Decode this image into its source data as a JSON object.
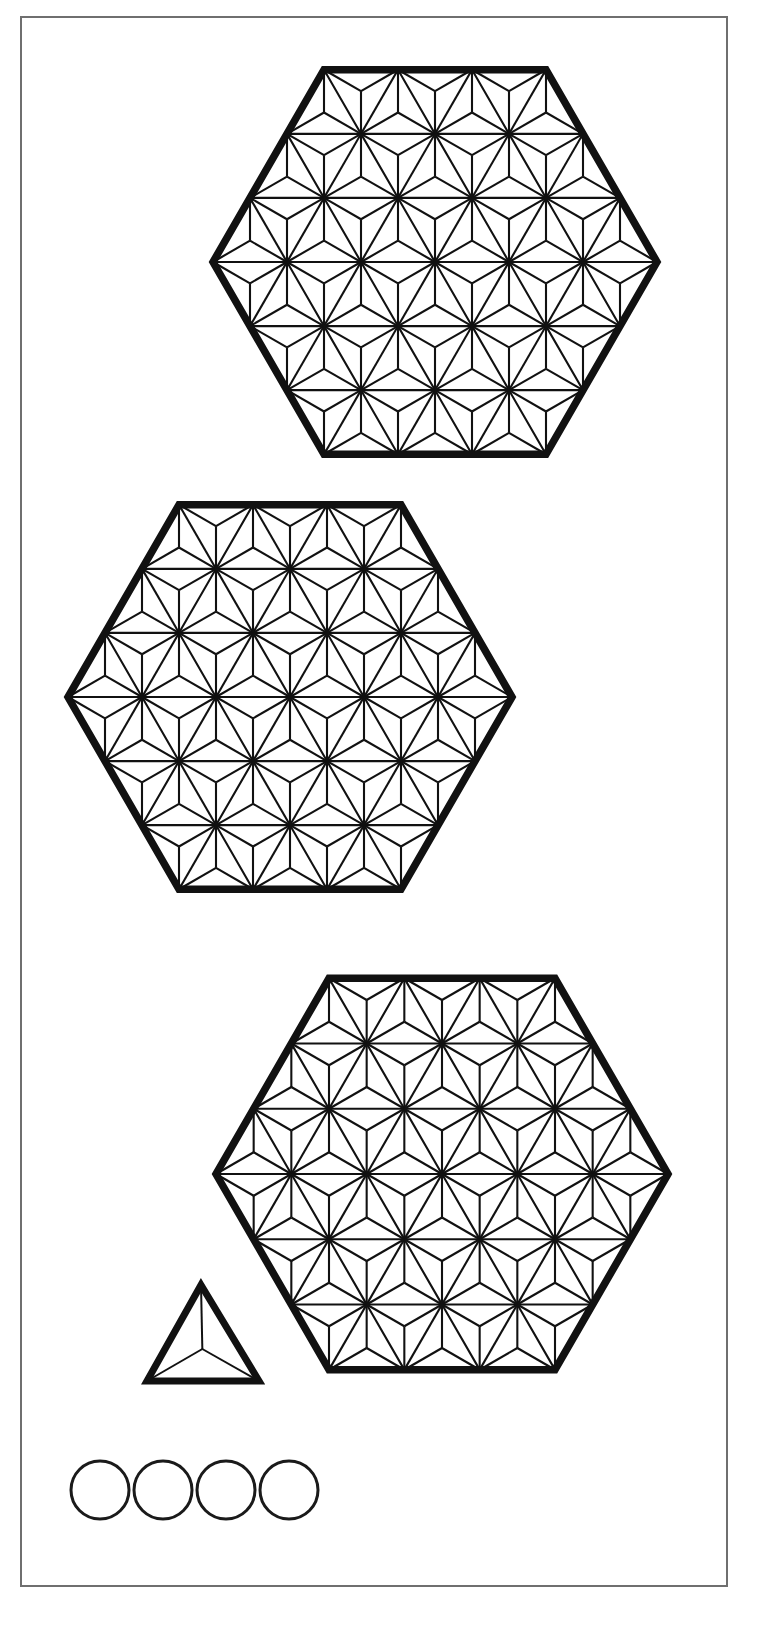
{
  "sheet": {
    "title": "Asanoha Hexagon Template Sheet",
    "width": 757,
    "height": 1626,
    "background_color": "#ffffff",
    "ink_color": "#111111",
    "frame_color": "#6f6f6f"
  },
  "page_frame": {
    "name": "page-border",
    "x": 21,
    "y": 17,
    "width": 706,
    "height": 1569,
    "stroke_width": 2,
    "color": "#6f6f6f"
  },
  "pattern": {
    "name": "asanoha-hemp-leaf",
    "description": "Triangular lattice with a three-armed Y star inside every lattice hexagon",
    "cells_across": 3,
    "lattice_stroke_width": 2.1,
    "outline_stroke_width": 7.5,
    "star_arms": 3
  },
  "shapes": {
    "hexagons": [
      {
        "label": "hexagon-top",
        "orientation": "flat-top",
        "center_x": 435,
        "center_y": 262,
        "radius": 222,
        "rings": 3,
        "left_vertex_x": 213,
        "right_vertex_x": 657,
        "top_edge_y": 63,
        "bottom_edge_y": 462
      },
      {
        "label": "hexagon-middle",
        "orientation": "flat-top",
        "center_x": 290,
        "center_y": 697,
        "radius": 222,
        "rings": 3,
        "left_vertex_x": 68,
        "right_vertex_x": 512,
        "top_edge_y": 498,
        "bottom_edge_y": 896
      },
      {
        "label": "hexagon-bottom",
        "orientation": "flat-top",
        "center_x": 442,
        "center_y": 1174,
        "radius": 226,
        "rings": 3,
        "left_vertex_x": 216,
        "right_vertex_x": 668,
        "top_edge_y": 971,
        "bottom_edge_y": 1377
      }
    ],
    "triangle": {
      "label": "triangle-with-star",
      "apex_x": 201,
      "apex_y": 1285,
      "base_left_x": 147,
      "base_right_x": 259,
      "base_y": 1381,
      "star_arms": 3,
      "stroke_width": 7
    },
    "circles": [
      {
        "label": "circle-1",
        "cx": 100,
        "cy": 1490,
        "r": 29
      },
      {
        "label": "circle-2",
        "cx": 163,
        "cy": 1490,
        "r": 29
      },
      {
        "label": "circle-3",
        "cx": 226,
        "cy": 1490,
        "r": 29
      },
      {
        "label": "circle-4",
        "cx": 289,
        "cy": 1490,
        "r": 29
      }
    ]
  },
  "counts": {
    "hexagons": 3,
    "triangles": 1,
    "circles": 4
  }
}
